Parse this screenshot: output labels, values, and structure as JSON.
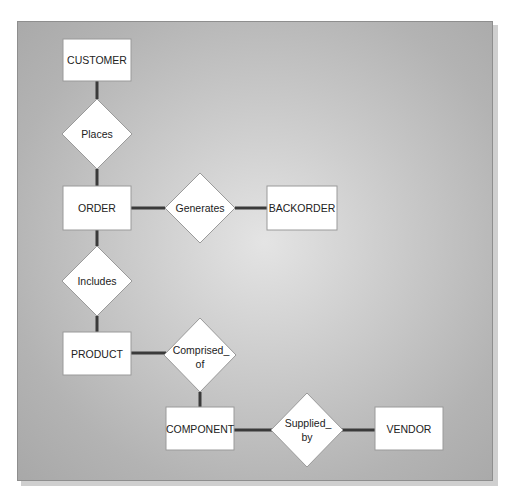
{
  "diagram": {
    "type": "entity-relationship",
    "entities": [
      {
        "id": "customer",
        "label": "CUSTOMER",
        "x": 63,
        "y": 39,
        "w": 68,
        "h": 42
      },
      {
        "id": "order",
        "label": "ORDER",
        "x": 63,
        "y": 186,
        "w": 68,
        "h": 44
      },
      {
        "id": "backorder",
        "label": "BACKORDER",
        "x": 267,
        "y": 186,
        "w": 70,
        "h": 44
      },
      {
        "id": "product",
        "label": "PRODUCT",
        "x": 63,
        "y": 332,
        "w": 68,
        "h": 43
      },
      {
        "id": "component",
        "label": "COMPONENT",
        "x": 166,
        "y": 407,
        "w": 68,
        "h": 43
      },
      {
        "id": "vendor",
        "label": "VENDOR",
        "x": 375,
        "y": 407,
        "w": 68,
        "h": 43
      }
    ],
    "relationships": [
      {
        "id": "places",
        "lines": [
          "Places"
        ],
        "cx": 97,
        "cy": 134
      },
      {
        "id": "generates",
        "lines": [
          "Generates"
        ],
        "cx": 200,
        "cy": 208
      },
      {
        "id": "includes",
        "lines": [
          "Includes"
        ],
        "cx": 97,
        "cy": 281
      },
      {
        "id": "comprised_of",
        "lines": [
          "Comprised_",
          "of"
        ],
        "cx": 200,
        "cy": 357
      },
      {
        "id": "supplied_by",
        "lines": [
          "Supplied_",
          "by"
        ],
        "cx": 307,
        "cy": 432
      }
    ],
    "connections": [
      [
        "customer",
        "places"
      ],
      [
        "places",
        "order"
      ],
      [
        "order",
        "generates"
      ],
      [
        "generates",
        "backorder"
      ],
      [
        "order",
        "includes"
      ],
      [
        "includes",
        "product"
      ],
      [
        "product",
        "comprised_of"
      ],
      [
        "comprised_of",
        "component"
      ],
      [
        "component",
        "supplied_by"
      ],
      [
        "supplied_by",
        "vendor"
      ]
    ],
    "labels": {
      "customer": "CUSTOMER",
      "order": "ORDER",
      "backorder": "BACKORDER",
      "product": "PRODUCT",
      "component": "COMPONENT",
      "vendor": "VENDOR",
      "places": "Places",
      "generates": "Generates",
      "includes": "Includes",
      "comprised_1": "Comprised_",
      "comprised_2": "of",
      "supplied_1": "Supplied_",
      "supplied_2": "by"
    }
  }
}
